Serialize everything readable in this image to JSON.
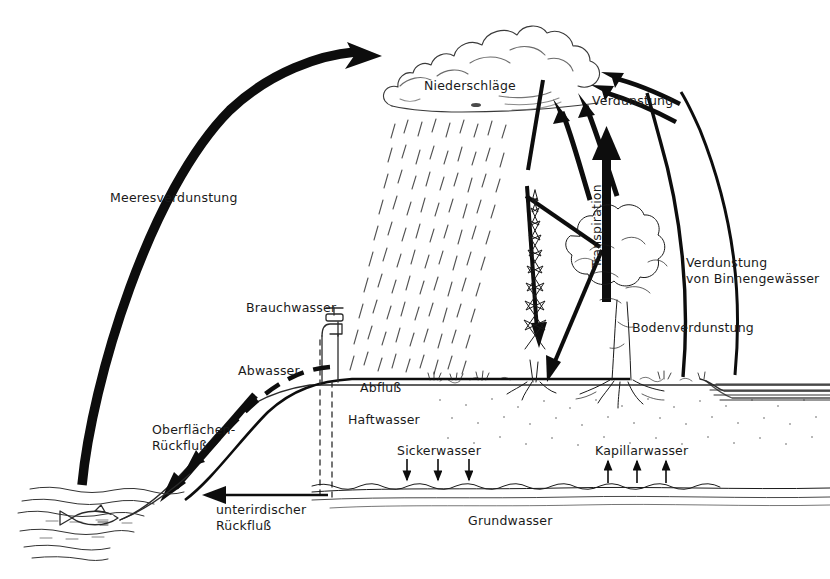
{
  "diagram": {
    "language": "de",
    "background_color": "#ffffff",
    "ink_color": "#1a1a1a"
  },
  "labels": {
    "meeresverdunstung": "Meeresverdunstung",
    "niederschlaege": "Niederschläge",
    "verdunstung": "Verdunstung",
    "transpiration": "Transpiration",
    "verdunstung_binnen_line1": "Verdunstung",
    "verdunstung_binnen_line2": "von Binnengewässer",
    "bodenverdunstung": "Bodenverdunstung",
    "brauchwasser": "Brauchwasser",
    "abwasser": "Abwasser",
    "abfluss": "Abfluß",
    "haftwasser": "Haftwasser",
    "oberflaechen_line1": "Oberflächen-",
    "oberflaechen_line2": "Rückfluß",
    "sickerwasser": "Sickerwasser",
    "kapillarwasser": "Kapillarwasser",
    "unterirdischer_line1": "unterirdischer",
    "unterirdischer_line2": "Rückfluß",
    "grundwasser": "Grundwasser"
  },
  "elements": {
    "cloud": "cumulus-cloud",
    "rain": "rain-streaks",
    "fish": "fish-in-sea",
    "faucet": "water-tap",
    "conifer": "fir-tree",
    "deciduous": "broadleaf-tree",
    "lake": "inland-water-body",
    "sea": "sea-ocean",
    "groundwater": "groundwater-layer"
  },
  "flows": [
    {
      "name": "Meeresverdunstung",
      "from": "sea",
      "to": "cloud",
      "style": "thick-curved-arrow"
    },
    {
      "name": "Niederschläge",
      "from": "cloud",
      "to": "ground",
      "style": "rain-streaks"
    },
    {
      "name": "Verdunstung",
      "from": "surface",
      "to": "cloud",
      "style": "arrows"
    },
    {
      "name": "Transpiration",
      "from": "tree",
      "to": "cloud",
      "style": "thick-vertical-arrow"
    },
    {
      "name": "Verdunstung von Binnengewässer",
      "from": "lake",
      "to": "cloud",
      "style": "thin-curved-arrow"
    },
    {
      "name": "Bodenverdunstung",
      "from": "soil",
      "to": "cloud",
      "style": "thin-curved-arrow"
    },
    {
      "name": "Brauchwasser",
      "from": "groundwater",
      "to": "faucet",
      "style": "dashed-line"
    },
    {
      "name": "Abwasser",
      "from": "faucet",
      "to": "sea",
      "style": "dashed-arrow"
    },
    {
      "name": "Abfluß",
      "from": "slope",
      "to": "sea",
      "style": "solid-line"
    },
    {
      "name": "Oberflächen-Rückfluß",
      "from": "land",
      "to": "sea",
      "style": "thick-arrow"
    },
    {
      "name": "Sickerwasser",
      "from": "soil",
      "to": "groundwater",
      "style": "down-arrows",
      "count": 3
    },
    {
      "name": "Kapillarwasser",
      "from": "groundwater",
      "to": "soil",
      "style": "up-arrows",
      "count": 3
    },
    {
      "name": "unterirdischer Rückfluß",
      "from": "groundwater",
      "to": "sea",
      "style": "horizontal-arrow"
    }
  ]
}
